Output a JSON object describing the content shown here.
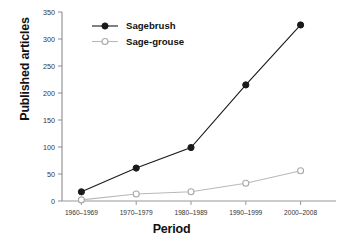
{
  "chart_data": {
    "type": "line",
    "title": "",
    "xlabel": "Period",
    "ylabel": "Published articles",
    "categories": [
      "1960–1969",
      "1970–1979",
      "1980–1989",
      "1990–1999",
      "2000–2008"
    ],
    "series": [
      {
        "name": "Sagebrush",
        "values": [
          17,
          61,
          99,
          215,
          326
        ],
        "marker": "filled-circle",
        "color": "#1a1a1a"
      },
      {
        "name": "Sage-grouse",
        "values": [
          2,
          13,
          17,
          33,
          56
        ],
        "marker": "open-circle",
        "color": "#b9b9b9"
      }
    ],
    "ylim": [
      0,
      350
    ],
    "yticks": [
      0,
      50,
      100,
      150,
      200,
      250,
      300,
      350
    ],
    "ytick_labels": [
      "0",
      "50",
      "100",
      "150",
      "200",
      "250",
      "300",
      "350"
    ],
    "grid": false,
    "legend_position": "top-left"
  },
  "axes": {
    "y_title": "Published articles",
    "x_title": "Period"
  },
  "legend": {
    "entries": [
      {
        "label": "Sagebrush",
        "marker": "filled-circle"
      },
      {
        "label": "Sage-grouse",
        "marker": "open-circle"
      }
    ]
  }
}
